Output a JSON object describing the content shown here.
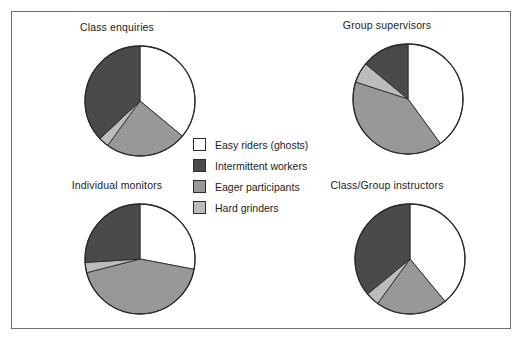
{
  "figure": {
    "border_color": "#6e6e6e",
    "background": "#ffffff"
  },
  "legend": {
    "title": "",
    "entries": [
      {
        "label": "Easy riders (ghosts)",
        "color": "#ffffff",
        "key": "easy_riders"
      },
      {
        "label": "Intermittent workers",
        "color": "#4a4a4a",
        "key": "intermittent_workers"
      },
      {
        "label": "Eager participants",
        "color": "#989898",
        "key": "eager_participants"
      },
      {
        "label": "Hard grinders",
        "color": "#bcbcbc",
        "key": "hard_grinders"
      }
    ]
  },
  "panels": [
    {
      "id": "class-enquiries",
      "title": "Class enquiries"
    },
    {
      "id": "group-supervisors",
      "title": "Group supervisors"
    },
    {
      "id": "individual-monitors",
      "title": "Individual monitors"
    },
    {
      "id": "class-group-instructors",
      "title": "Class/Group instructors"
    }
  ],
  "chart_data": [
    {
      "type": "pie",
      "title": "Class enquiries",
      "categories": [
        "Easy riders (ghosts)",
        "Eager participants",
        "Hard grinders",
        "Intermittent workers"
      ],
      "values": [
        36,
        24,
        3,
        37
      ],
      "unit": "percent",
      "colors": [
        "#ffffff",
        "#989898",
        "#bcbcbc",
        "#4a4a4a"
      ],
      "start_angle_deg": 0,
      "direction": "clockwise",
      "legend_position": "center"
    },
    {
      "type": "pie",
      "title": "Group supervisors",
      "categories": [
        "Easy riders (ghosts)",
        "Eager participants",
        "Hard grinders",
        "Intermittent workers"
      ],
      "values": [
        40,
        40,
        6,
        14
      ],
      "unit": "percent",
      "colors": [
        "#ffffff",
        "#989898",
        "#bcbcbc",
        "#4a4a4a"
      ],
      "start_angle_deg": 0,
      "direction": "clockwise",
      "legend_position": "center"
    },
    {
      "type": "pie",
      "title": "Individual monitors",
      "categories": [
        "Easy riders (ghosts)",
        "Eager participants",
        "Hard grinders",
        "Intermittent workers"
      ],
      "values": [
        28,
        43,
        3,
        26
      ],
      "unit": "percent",
      "colors": [
        "#ffffff",
        "#989898",
        "#bcbcbc",
        "#4a4a4a"
      ],
      "start_angle_deg": 0,
      "direction": "clockwise",
      "legend_position": "center"
    },
    {
      "type": "pie",
      "title": "Class/Group instructors",
      "categories": [
        "Easy riders (ghosts)",
        "Eager participants",
        "Hard grinders",
        "Intermittent workers"
      ],
      "values": [
        39,
        21,
        4,
        36
      ],
      "unit": "percent",
      "colors": [
        "#ffffff",
        "#989898",
        "#bcbcbc",
        "#4a4a4a"
      ],
      "start_angle_deg": 0,
      "direction": "clockwise",
      "legend_position": "center"
    }
  ]
}
